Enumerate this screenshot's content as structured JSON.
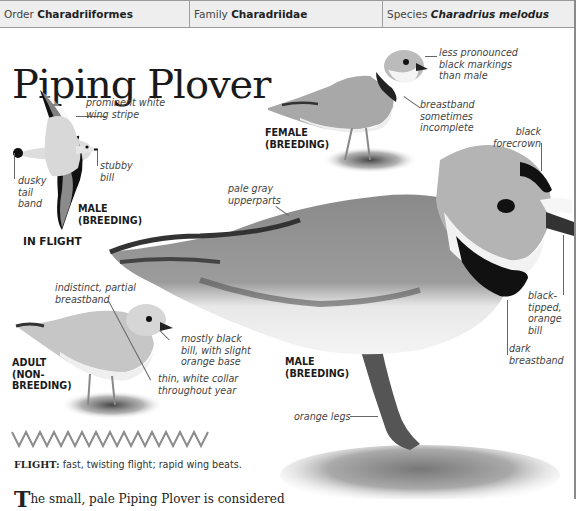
{
  "taxonomy": {
    "order_label": "Order",
    "order_value": "Charadriiformes",
    "family_label": "Family",
    "family_value": "Charadriidae",
    "species_label": "Species",
    "species_value": "Charadrius melodus"
  },
  "title": "Piping Plover",
  "in_flight": {
    "heading": "IN FLIGHT",
    "sex_label": "MALE\n(BREEDING)",
    "annotations": {
      "wing_stripe": "prominent white\nwing stripe",
      "bill": "stubby\nbill",
      "tail": "dusky\ntail\nband"
    }
  },
  "female": {
    "label": "FEMALE\n(BREEDING)",
    "annotations": {
      "markings": "less pronounced\nblack markings\nthan male",
      "breastband": "breastband\nsometimes\nincomplete"
    }
  },
  "male": {
    "label": "MALE\n(BREEDING)",
    "annotations": {
      "forecrown": "black\nforecrown",
      "upperparts": "pale gray\nupperparts",
      "bill": "black-\ntipped,\norange\nbill",
      "breastband": "dark\nbreastband",
      "legs": "orange legs"
    }
  },
  "nonbreeding": {
    "label": "ADULT\n(NON-\nBREEDING)",
    "annotations": {
      "breastband": "indistinct, partial\nbreastband",
      "bill": "mostly black\nbill, with slight\norange base",
      "collar": "thin, white collar\nthroughout year"
    }
  },
  "flight_pattern": {
    "label": "FLIGHT:",
    "description": "fast, twisting flight; rapid wing beats."
  },
  "body_text": {
    "dropcap": "T",
    "text": "he small, pale Piping Plover is considered"
  },
  "colors": {
    "header_bg": "#eeeeee",
    "border": "#9a9a9a",
    "zigzag": "#8c8c8c"
  }
}
